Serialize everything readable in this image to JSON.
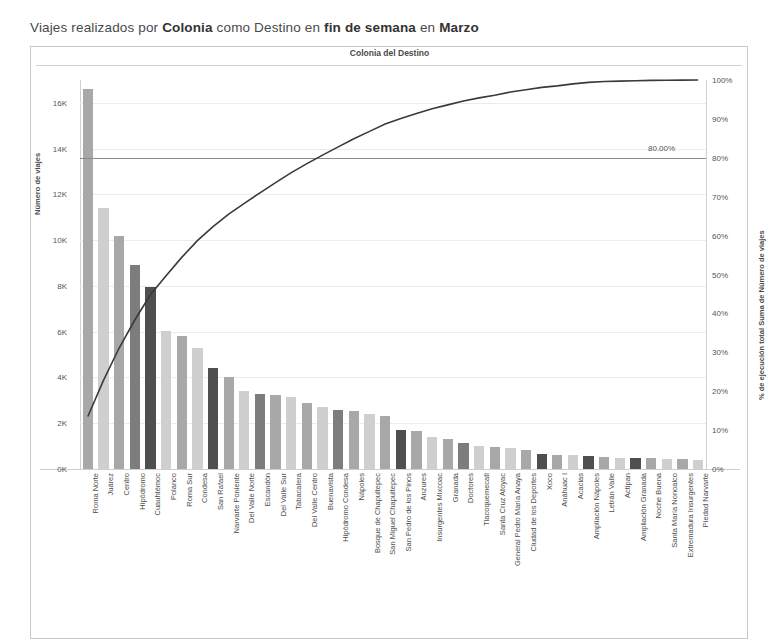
{
  "title": {
    "prefix": "Viajes realizados por ",
    "b1": "Colonia",
    "mid1": " como Destino en ",
    "b2": "fin de semana",
    "mid2": " en ",
    "b3": "Marzo",
    "full": "Viajes realizados por Colonia como Destino en fin de semana en Marzo"
  },
  "subtitle": "Colonia del Destino",
  "axes": {
    "left_title": "Número de viajes",
    "right_title": "% de ejecución total Suma de Número de viajes",
    "left_ticks": [
      "0K",
      "2K",
      "4K",
      "6K",
      "8K",
      "10K",
      "12K",
      "14K",
      "16K"
    ],
    "right_ticks": [
      "0%",
      "10%",
      "20%",
      "30%",
      "40%",
      "50%",
      "60%",
      "70%",
      "80%",
      "90%",
      "100%"
    ]
  },
  "reference_line": {
    "label": "80.00%",
    "value": 80
  },
  "colors": {
    "bar_light": "#cfcfcf",
    "bar_mid": "#a8a8a8",
    "bar_dark": "#7d7d7d",
    "bar_darkest": "#4f4f4f",
    "curve": "#3a3a3a",
    "grid": "#ececec",
    "text": "#4a4a4a"
  },
  "chart_data": {
    "type": "bar",
    "title": "Viajes realizados por Colonia como Destino en fin de semana en Marzo",
    "subtitle": "Colonia del Destino",
    "xlabel": "Colonia del Destino",
    "ylabel": "Número de viajes",
    "y2label": "% de ejecución total Suma de Número de viajes",
    "ylim": [
      0,
      17000
    ],
    "y2lim": [
      0,
      100
    ],
    "grid": true,
    "legend": "none",
    "annotations": [
      "80.00%"
    ],
    "categories": [
      "Roma Norte",
      "Juárez",
      "Centro",
      "Hipódromo",
      "Cuauhtémoc",
      "Polanco",
      "Roma Sur",
      "Condesa",
      "San Rafael",
      "Narvarte Poniente",
      "Del Valle Norte",
      "Escandón",
      "Del Valle Sur",
      "Tabacalera",
      "Del Valle Centro",
      "Buenavista",
      "Hipódromo Condesa",
      "Nápoles",
      "Bosque de Chapultepec",
      "San Miguel Chapultepec",
      "San Pedro de los Pinos",
      "Anzures",
      "Insurgentes Mixcoac",
      "Granada",
      "Doctores",
      "Tlacoquemecatl",
      "Santa Cruz Atoyac",
      "General Pedro María Anaya",
      "Ciudad de los Deportes",
      "Xoco",
      "Anáhuac I",
      "Acacias",
      "Ampliación Nápoles",
      "Letrán Valle",
      "Actipan",
      "Ampliación Granada",
      "Noche Buena",
      "Santa María Nonoalco",
      "Extremadura Insurgentes",
      "Piedad Narvarte"
    ],
    "series": [
      {
        "name": "Número de viajes",
        "type": "bar",
        "values": [
          16600,
          11400,
          10200,
          8900,
          7950,
          6050,
          5800,
          5300,
          4400,
          4000,
          3400,
          3300,
          3250,
          3150,
          2900,
          2700,
          2600,
          2550,
          2400,
          2300,
          1700,
          1650,
          1400,
          1300,
          1150,
          1000,
          950,
          900,
          850,
          650,
          600,
          600,
          550,
          520,
          500,
          500,
          480,
          450,
          430,
          400
        ]
      },
      {
        "name": "% de ejecución total Suma de Número de viajes",
        "type": "line",
        "axis": "right",
        "values": [
          13.5,
          22.8,
          31.1,
          38.3,
          44.8,
          49.7,
          54.4,
          58.7,
          62.3,
          65.5,
          68.3,
          71.0,
          73.6,
          76.2,
          78.5,
          80.7,
          82.8,
          84.9,
          86.8,
          88.7,
          90.1,
          91.4,
          92.6,
          93.6,
          94.6,
          95.4,
          96.1,
          96.9,
          97.5,
          98.1,
          98.5,
          99.0,
          99.4,
          99.6,
          99.7,
          99.8,
          99.9,
          99.95,
          99.98,
          100.0
        ]
      }
    ],
    "bar_shades": [
      "mid",
      "light",
      "mid",
      "dark",
      "darkest",
      "light",
      "mid",
      "light",
      "darkest",
      "mid",
      "light",
      "dark",
      "mid",
      "light",
      "mid",
      "light",
      "dark",
      "mid",
      "light",
      "mid",
      "darkest",
      "mid",
      "light",
      "mid",
      "dark",
      "light",
      "mid",
      "light",
      "mid",
      "darkest",
      "mid",
      "light",
      "darkest",
      "mid",
      "light",
      "darkest",
      "mid",
      "light",
      "mid",
      "light"
    ]
  }
}
